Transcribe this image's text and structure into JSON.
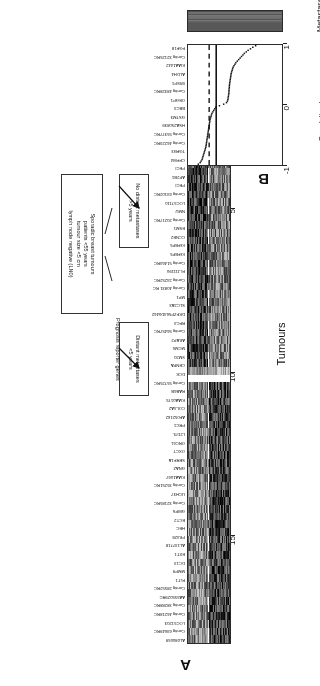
{
  "figure": {
    "rotation_deg": 180,
    "panels": [
      {
        "letter": "A",
        "name": "heatmap-panel"
      },
      {
        "letter": "B",
        "name": "correlation-panel"
      }
    ]
  },
  "panel_a": {
    "letter": "A",
    "y_axis": {
      "title": "Tumours",
      "ticks": [
        "5",
        "10",
        "15"
      ],
      "tick_values": [
        5,
        10,
        15
      ]
    },
    "annotations": {
      "cohort_box": "Sporadic breast tumours\npatients <55 years\ntumour size <5 cm\nlymph node negative (LN0)",
      "cohort_box_lines": [
        "Sporadic breast tumours",
        "patients <55 years",
        "tumour size <5 cm",
        "lymph node negative (LN0)"
      ],
      "reporter_label": "Prognosis reporter genes",
      "group_distant_lines": [
        "Distant metastases",
        "<5 years"
      ],
      "group_nodistant_lines": [
        "No distant metastases",
        ">5 years"
      ]
    },
    "gene_labels": [
      "AL080059",
      "Contig 63649RC",
      "LOC51203",
      "Contig 46218RC",
      "Contig 38288RC",
      "AA555029RC",
      "Contig 28552RC",
      "FLT1",
      "MMP9",
      "DC13",
      "EXT1",
      "AL137718",
      "PK428",
      "HEC",
      "ECT2",
      "GMPS",
      "Contig 32185RC",
      "UCH37",
      "Contig 35251RC",
      "KIAA1067",
      "GNAZ",
      "SERF1A",
      "OXCT",
      "ORC6L",
      "L2DTL",
      "PRC1",
      "AF052162",
      "COL4A2",
      "KIAA0175",
      "RAB6B",
      "Contig 55725RC",
      "DCK",
      "CENPA",
      "SM20",
      "MCM6",
      "AKAP2",
      "Contig 56457RC",
      "RFC4",
      "DKFZP564D0462",
      "SLC2A3",
      "MP1",
      "Contig 40831 RC",
      "Contig 24252RC",
      "FLJ11190",
      "Contig 51464RC",
      "IGFBP5",
      "IGFBP5",
      "CCNE2",
      "ESM1",
      "Contig 20217RC",
      "NMU",
      "LOC57110",
      "Contig 63102RC",
      "PECI",
      "AP2B1",
      "PECI",
      "CFFM4",
      "TGFB3",
      "Contig 46223RC",
      "Contig 55377RC",
      "HSA250839",
      "GSTM3",
      "BBC3",
      "OEGP1",
      "Contig 48328RC",
      "WISP1",
      "ALDH4",
      "KIAA1442",
      "Contig 32125RC",
      "FGF18"
    ],
    "heatmap": {
      "columns": 70,
      "rows": 78,
      "colormap": "grayscale",
      "row_divider_after": 34,
      "note": "grayscale expression heatmap, 70 prognosis reporter genes x 78 tumours"
    }
  },
  "panel_b": {
    "letter": "B",
    "correlation_plot": {
      "x_axis_title_lines": [
        "Correlation to average",
        "good prognosis profile"
      ],
      "x_ticks": [
        "-1",
        "0",
        "1"
      ],
      "x_tick_values": [
        -1,
        0,
        1
      ],
      "xlim": [
        -1,
        1
      ],
      "solid_threshold_line": 0.4,
      "dashed_threshold_line": 0.55,
      "series_name": "tumour correlation",
      "values": [
        0.78,
        0.74,
        0.72,
        0.7,
        0.69,
        0.68,
        0.67,
        0.66,
        0.65,
        0.64,
        0.63,
        0.62,
        0.615,
        0.61,
        0.605,
        0.6,
        0.595,
        0.59,
        0.585,
        0.58,
        0.575,
        0.57,
        0.565,
        0.56,
        0.555,
        0.55,
        0.545,
        0.54,
        0.535,
        0.53,
        0.52,
        0.51,
        0.5,
        0.49,
        0.47,
        0.45,
        0.43,
        0.41,
        0.33,
        0.24,
        0.18,
        0.16,
        0.15,
        0.145,
        0.14,
        0.135,
        0.13,
        0.128,
        0.126,
        0.124,
        0.12,
        0.118,
        0.115,
        0.11,
        0.105,
        0.1,
        0.095,
        0.09,
        0.085,
        0.08,
        0.07,
        0.06,
        0.05,
        0.04,
        0.02,
        0.0,
        -0.02,
        -0.05,
        -0.08,
        -0.11,
        -0.14,
        -0.17,
        -0.2,
        -0.24,
        -0.28,
        -0.33,
        -0.38,
        -0.44
      ]
    },
    "metastases_strip": {
      "label": "Metastases",
      "legend": "black = metastasis within 5 years, white = no metastasis",
      "cells": [
        1,
        1,
        1,
        1,
        1,
        1,
        1,
        1,
        1,
        1,
        1,
        1,
        1,
        1,
        1,
        1,
        1,
        1,
        1,
        1,
        1,
        1,
        1,
        1,
        1,
        1,
        1,
        1,
        1,
        1,
        1,
        1,
        1,
        1,
        0,
        1,
        0,
        1,
        0,
        0,
        0,
        0,
        0,
        0,
        0,
        0,
        0,
        0,
        0,
        0,
        0,
        0,
        0,
        0,
        0,
        0,
        0,
        0,
        0,
        0,
        0,
        0,
        0,
        0,
        0,
        0,
        0,
        0,
        0,
        0,
        0,
        0,
        0,
        1,
        1,
        1
      ]
    }
  },
  "colors": {
    "frame": "#2b2b2b",
    "text": "#111111",
    "background": "#ffffff",
    "heat_low": "#000000",
    "heat_high": "#f0f0f0",
    "divider": "#ffffff"
  }
}
